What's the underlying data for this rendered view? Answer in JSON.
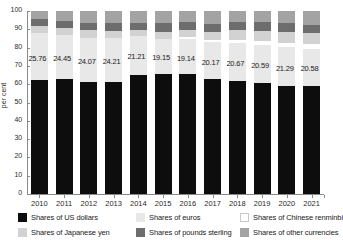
{
  "chart_data": {
    "type": "bar",
    "stacked": true,
    "title": "",
    "xlabel": "",
    "ylabel": "per cent",
    "ylim": [
      0,
      100
    ],
    "yticks": [
      0,
      10,
      20,
      30,
      40,
      50,
      60,
      70,
      80,
      90,
      100
    ],
    "grid": false,
    "legend_position": "bottom",
    "categories": [
      "2010",
      "2011",
      "2012",
      "2013",
      "2014",
      "2015",
      "2016",
      "2017",
      "2018",
      "2019",
      "2020",
      "2021"
    ],
    "series": [
      {
        "name": "Shares of US dollars",
        "color": "#0d0d0d",
        "values": [
          62.2,
          62.6,
          61.4,
          61.2,
          65.1,
          65.7,
          65.4,
          62.7,
          61.8,
          60.8,
          58.9,
          58.8
        ]
      },
      {
        "name": "Shares of euros",
        "color": "#e8e8e8",
        "values": [
          25.76,
          24.45,
          24.07,
          24.21,
          21.21,
          19.15,
          19.14,
          20.17,
          20.67,
          20.59,
          21.29,
          20.58
        ]
      },
      {
        "name": "Shares of Chinese renminbi",
        "color": "#ffffff",
        "values": [
          0.0,
          0.0,
          0.0,
          0.0,
          0.0,
          0.0,
          1.08,
          1.23,
          1.89,
          1.94,
          2.29,
          2.79
        ]
      },
      {
        "name": "Shares of Japanese yen",
        "color": "#d2d2d2",
        "values": [
          3.66,
          3.61,
          4.09,
          3.82,
          3.54,
          3.75,
          3.95,
          4.49,
          5.19,
          5.87,
          6.03,
          5.57
        ]
      },
      {
        "name": "Shares of pounds sterling",
        "color": "#6d6d6d",
        "values": [
          3.94,
          3.83,
          4.04,
          3.98,
          3.7,
          4.72,
          4.34,
          4.54,
          4.43,
          4.64,
          4.72,
          4.78
        ]
      },
      {
        "name": "Shares of other currencies",
        "color": "#a3a3a3",
        "values": [
          4.44,
          5.51,
          6.4,
          6.79,
          6.45,
          6.68,
          6.09,
          6.87,
          6.02,
          6.16,
          6.77,
          7.48
        ]
      }
    ],
    "data_labels": {
      "series": "Shares of euros",
      "values": [
        "25.76",
        "24.45",
        "24.07",
        "24.21",
        "21.21",
        "19.15",
        "19.14",
        "20.17",
        "20.67",
        "20.59",
        "21.29",
        "20.58"
      ]
    }
  },
  "legend": {
    "items": [
      {
        "label": "Shares of US dollars",
        "swatch": "sw-usd"
      },
      {
        "label": "Shares of euros",
        "swatch": "sw-eur"
      },
      {
        "label": "Shares of Chinese renminbi",
        "swatch": "sw-rmb"
      },
      {
        "label": "Shares of Japanese yen",
        "swatch": "sw-jpy"
      },
      {
        "label": "Shares of pounds sterling",
        "swatch": "sw-gbp"
      },
      {
        "label": "Shares of other currencies",
        "swatch": "sw-other"
      }
    ]
  }
}
